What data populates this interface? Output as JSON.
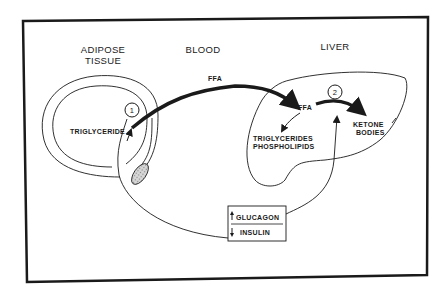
{
  "diagram": {
    "regions": {
      "adipose": [
        "ADIPOSE",
        "TISSUE"
      ],
      "blood": "BLOOD",
      "liver": "LIVER"
    },
    "nodes": {
      "triglyceride": "TRIGLYCERIDE",
      "ffa_blood": "FFA",
      "ffa_liver": "FFA",
      "triglycerides": "TRIGLYCERIDES",
      "phospholipids": "PHOSPHOLIPIDS",
      "ketone": [
        "KETONE",
        "BODIES"
      ]
    },
    "steps": {
      "step1": "1",
      "step2": "2"
    },
    "hormones": {
      "glucagon": {
        "label": "GLUCAGON",
        "direction": "up"
      },
      "insulin": {
        "label": "INSULIN",
        "direction": "down"
      }
    },
    "colors": {
      "ink": "#1a1a1a",
      "background": "#ffffff",
      "shading": "#bbbbbb"
    }
  }
}
